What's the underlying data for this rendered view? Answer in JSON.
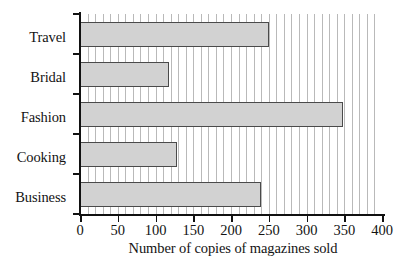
{
  "chart_data": {
    "type": "bar",
    "orientation": "horizontal",
    "title": "",
    "subtitle": "",
    "xlabel": "Number of copies of magazines sold",
    "ylabel": "",
    "categories": [
      "Business",
      "Cooking",
      "Fashion",
      "Bridal",
      "Travel"
    ],
    "values": [
      240,
      128,
      348,
      118,
      250
    ],
    "series": [
      {
        "name": "Number of copies of magazines sold",
        "values": [
          240,
          128,
          348,
          118,
          250
        ]
      }
    ],
    "xlim": [
      0,
      400
    ],
    "xticks": [
      0,
      50,
      100,
      150,
      200,
      250,
      300,
      350,
      400
    ],
    "xtick_labels": [
      "0",
      "50",
      "100",
      "150",
      "200",
      "250",
      "300",
      "350",
      "400"
    ],
    "minor_gridline_step": 10,
    "grid": "vertical-minor-only",
    "legend": "none",
    "bar_fill_color": "#d2d2d2",
    "bar_border_color": "#4a4a4a",
    "gridline_color": "#b9b9b9",
    "axis_color": "#111111",
    "background_color": "#ffffff"
  },
  "axis": {
    "x_title": "Number of copies of magazines sold",
    "tick_labels": [
      "0",
      "50",
      "100",
      "150",
      "200",
      "250",
      "300",
      "350",
      "400"
    ],
    "category_labels_top_to_bottom": [
      "Travel",
      "Bridal",
      "Fashion",
      "Cooking",
      "Business"
    ]
  }
}
